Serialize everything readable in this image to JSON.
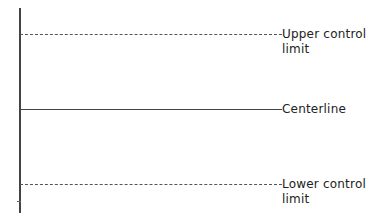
{
  "diagram": {
    "title": "",
    "lines": [
      {
        "id": "ucl",
        "style": "dashed",
        "label_line1": "Upper control",
        "label_line2": "limit"
      },
      {
        "id": "cl",
        "style": "solid",
        "label_line1": "Centerline"
      },
      {
        "id": "lcl",
        "style": "dashed",
        "label_line1": "Lower control",
        "label_line2": "limit"
      }
    ]
  },
  "colors": {
    "line": "#444444",
    "background": "#ffffff"
  }
}
